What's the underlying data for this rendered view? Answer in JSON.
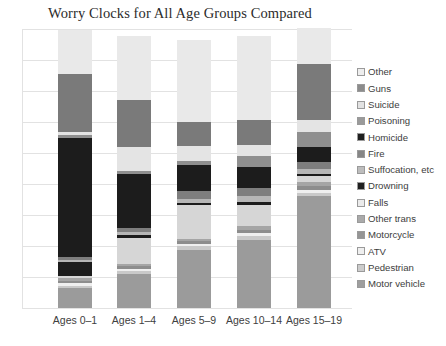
{
  "chart_data": {
    "type": "bar",
    "subtype": "stacked-bar-100-percent",
    "title": "Worry Clocks for All Age Groups Compared",
    "xlabel": "",
    "ylabel": "",
    "grid": true,
    "gridlines": 9,
    "legend_position": "right",
    "categories": [
      "Ages 0–1",
      "Ages 1–4",
      "Ages 5–9",
      "Ages 10–14",
      "Ages 15–19"
    ],
    "series_order_bottom_to_top": [
      "Motor vehicle",
      "Pedestrian",
      "ATV",
      "Motorcycle",
      "Other trans",
      "Falls",
      "Drowning",
      "Suffocation, etc",
      "Fire",
      "Homicide",
      "Poisoning",
      "Suicide",
      "Guns",
      "Other"
    ],
    "series": [
      {
        "name": "Motor vehicle",
        "color": "#9b9b9b",
        "values": [
          7.0,
          12.5,
          21.5,
          25.0,
          40.0
        ]
      },
      {
        "name": "Pedestrian",
        "color": "#c9c9c9",
        "values": [
          1.0,
          1.0,
          1.5,
          1.5,
          1.0
        ]
      },
      {
        "name": "ATV",
        "color": "#efefef",
        "values": [
          1.0,
          1.0,
          1.0,
          1.0,
          1.0
        ]
      },
      {
        "name": "Motorcycle",
        "color": "#8d8d8d",
        "values": [
          0.8,
          0.8,
          0.8,
          1.0,
          1.5
        ]
      },
      {
        "name": "Other trans",
        "color": "#a5a5a5",
        "values": [
          0.8,
          1.0,
          1.0,
          1.5,
          1.5
        ]
      },
      {
        "name": "Falls",
        "color": "#d6d6d6",
        "values": [
          1.0,
          9.5,
          12.5,
          8.0,
          2.0
        ]
      },
      {
        "name": "Drowning",
        "color": "#1c1c1c",
        "values": [
          5.0,
          1.0,
          1.0,
          1.0,
          1.0
        ]
      },
      {
        "name": "Suffocation, etc",
        "color": "#b6b6b6",
        "values": [
          0.8,
          1.0,
          1.2,
          2.0,
          1.5
        ]
      },
      {
        "name": "Fire",
        "color": "#7e7e7e",
        "values": [
          0.8,
          1.5,
          3.0,
          3.0,
          2.5
        ]
      },
      {
        "name": "Homicide",
        "color": "#1c1c1c",
        "values": [
          43.0,
          20.0,
          10.0,
          8.0,
          5.5
        ]
      },
      {
        "name": "Poisoning",
        "color": "#8f8f8f",
        "values": [
          1.0,
          1.0,
          1.5,
          4.0,
          5.5
        ]
      },
      {
        "name": "Suicide",
        "color": "#e4e4e4",
        "values": [
          1.0,
          9.0,
          5.5,
          4.0,
          4.0
        ]
      },
      {
        "name": "Guns",
        "color": "#7a7a7a",
        "values": [
          21.0,
          17.0,
          9.0,
          9.0,
          20.0
        ]
      },
      {
        "name": "Other",
        "color": "#e9e9e9",
        "values": [
          15.8,
          23.7,
          30.5,
          31.0,
          13.0
        ]
      }
    ]
  },
  "legend": {
    "items": [
      {
        "label": "Other",
        "color": "#eeeeee"
      },
      {
        "label": "Guns",
        "color": "#8c8c8c"
      },
      {
        "label": "Suicide",
        "color": "#e2e2e2"
      },
      {
        "label": "Poisoning",
        "color": "#9a9a9a"
      },
      {
        "label": "Homicide",
        "color": "#1f1f1f"
      },
      {
        "label": "Fire",
        "color": "#868686"
      },
      {
        "label": "Suffocation, etc",
        "color": "#bdbdbd"
      },
      {
        "label": "Drowning",
        "color": "#1f1f1f"
      },
      {
        "label": "Falls",
        "color": "#ebebeb"
      },
      {
        "label": "Other trans",
        "color": "#aaaaaa"
      },
      {
        "label": "Motorcycle",
        "color": "#959595"
      },
      {
        "label": "ATV",
        "color": "#efefef"
      },
      {
        "label": "Pedestrian",
        "color": "#cccccc"
      },
      {
        "label": "Motor vehicle",
        "color": "#9e9e9e"
      }
    ]
  },
  "axis": {
    "x_tick_labels": [
      "Ages 0–1",
      "Ages 1–4",
      "Ages 5–9",
      "Ages 10–14",
      "Ages 15–19"
    ]
  }
}
